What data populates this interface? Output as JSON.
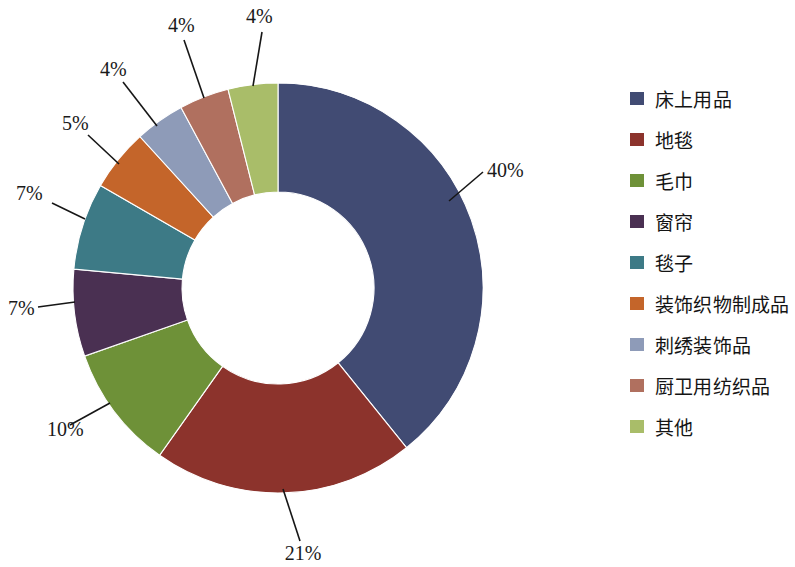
{
  "chart_data": {
    "type": "pie",
    "variant": "donut",
    "title": "",
    "subtitle": "",
    "xlabel": "",
    "ylabel": "",
    "grid": false,
    "legend_position": "right",
    "start_angle_deg": 0,
    "direction": "clockwise",
    "value_unit": "%",
    "categories": [
      "床上用品",
      "地毯",
      "毛巾",
      "窗帘",
      "毯子",
      "装饰织物制成品",
      "刺绣装饰品",
      "厨卫用纺织品",
      "其他"
    ],
    "values": [
      40,
      21,
      10,
      7,
      7,
      5,
      4,
      4,
      4
    ],
    "data_labels": [
      "40%",
      "21%",
      "10%",
      "7%",
      "7%",
      "5%",
      "4%",
      "4%",
      "4%"
    ],
    "colors": [
      "#414B73",
      "#8C332C",
      "#6E9138",
      "#4A3052",
      "#3D7A86",
      "#C4652A",
      "#8E9BB8",
      "#B0705F",
      "#A9BD69"
    ]
  },
  "legend": {
    "items": [
      {
        "label": "床上用品",
        "color": "#414B73"
      },
      {
        "label": "地毯",
        "color": "#8C332C"
      },
      {
        "label": "毛巾",
        "color": "#6E9138"
      },
      {
        "label": "窗帘",
        "color": "#4A3052"
      },
      {
        "label": "毯子",
        "color": "#3D7A86"
      },
      {
        "label": "装饰织物制成品",
        "color": "#C4652A"
      },
      {
        "label": "刺绣装饰品",
        "color": "#8E9BB8"
      },
      {
        "label": "厨卫用纺织品",
        "color": "#B0705F"
      },
      {
        "label": "其他",
        "color": "#A9BD69"
      }
    ]
  },
  "geometry": {
    "cx": 278,
    "cy": 288,
    "outer_radius": 205,
    "inner_radius": 96
  },
  "label_positions": [
    {
      "text": "40%",
      "x": 487,
      "y": 177,
      "anchor": "start",
      "lx1": 449,
      "ly1": 201,
      "lx2": 483,
      "ly2": 172
    },
    {
      "text": "21%",
      "x": 303,
      "y": 560,
      "anchor": "middle",
      "lx1": 283,
      "ly1": 489,
      "lx2": 300,
      "ly2": 541
    },
    {
      "text": "10%",
      "x": 47,
      "y": 436,
      "anchor": "start",
      "lx1": 110,
      "ly1": 403,
      "lx2": 70,
      "ly2": 425
    },
    {
      "text": "7%",
      "x": 8,
      "y": 315,
      "anchor": "start",
      "lx1": 75,
      "ly1": 302,
      "lx2": 38,
      "ly2": 307
    },
    {
      "text": "7%",
      "x": 16,
      "y": 200,
      "anchor": "start",
      "lx1": 85,
      "ly1": 219,
      "lx2": 52,
      "ly2": 203
    },
    {
      "text": "5%",
      "x": 62,
      "y": 130,
      "anchor": "start",
      "lx1": 119,
      "ly1": 164,
      "lx2": 88,
      "ly2": 135
    },
    {
      "text": "4%",
      "x": 100,
      "y": 76,
      "anchor": "start",
      "lx1": 157,
      "ly1": 126,
      "lx2": 123,
      "ly2": 82
    },
    {
      "text": "4%",
      "x": 168,
      "y": 32,
      "anchor": "start",
      "lx1": 204,
      "ly1": 98,
      "lx2": 184,
      "ly2": 40
    },
    {
      "text": "4%",
      "x": 246,
      "y": 23,
      "anchor": "start",
      "lx1": 253,
      "ly1": 86,
      "lx2": 262,
      "ly2": 32
    }
  ]
}
